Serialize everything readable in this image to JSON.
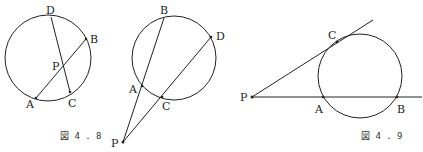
{
  "figures": [
    {
      "caption": "図4.8",
      "caption_display": "図 4 . 8",
      "labels": {
        "left": {
          "D": "D",
          "B": "B",
          "P": "P",
          "A": "A",
          "C": "C"
        },
        "right": {
          "B": "B",
          "D": "D",
          "A": "A",
          "C": "C",
          "P": "P"
        }
      }
    },
    {
      "caption": "図4.9",
      "caption_display": "図 4 . 9",
      "labels": {
        "C": "C",
        "P": "P",
        "A": "A",
        "B": "B"
      }
    }
  ],
  "colors": {
    "stroke": "#222222",
    "background": "#ffffff"
  }
}
